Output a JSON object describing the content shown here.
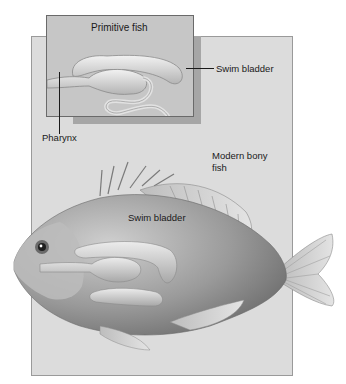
{
  "figure": {
    "panels": {
      "inset_title": "Primitive fish",
      "main_title_line1": "Modern bony",
      "main_title_line2": "fish"
    },
    "labels": {
      "primitive_swim_bladder": "Swim bladder",
      "pharynx": "Pharynx",
      "modern_swim_bladder": "Swim bladder"
    },
    "colors": {
      "main_panel": "#dcdcdc",
      "inset_panel": "#c6c6c6",
      "inset_shadow": "#a6a6a6",
      "fish_body": "#8c8c8c",
      "organ_highlight": "#e6e6e6"
    }
  }
}
